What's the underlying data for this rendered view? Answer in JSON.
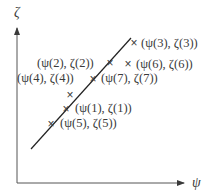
{
  "diagram": {
    "axes": {
      "y_label": "ζ",
      "x_label": "ψ"
    },
    "marker_glyph": "×",
    "fit_line": {
      "from": [
        31,
        149
      ],
      "to": [
        131,
        38
      ]
    },
    "points": [
      {
        "id": "p3",
        "label": "(ψ(3), ζ(3))",
        "mark": [
          134,
          44
        ],
        "label_pos": [
          141,
          47
        ]
      },
      {
        "id": "p2",
        "label": "(ψ(2), ζ(2))",
        "mark": [
          110,
          64
        ],
        "label_pos": [
          37,
          67
        ]
      },
      {
        "id": "p6",
        "label": "(ψ(6), ζ(6))",
        "mark": [
          128,
          65
        ],
        "label_pos": [
          136,
          68
        ]
      },
      {
        "id": "p4",
        "label": "(ψ(4), ζ(4))",
        "mark": null,
        "label_pos": [
          17,
          82
        ]
      },
      {
        "id": "p7",
        "label": "(ψ(7), ζ(7))",
        "mark": [
          93,
          80
        ],
        "label_pos": [
          101,
          82
        ]
      },
      {
        "id": "p8",
        "label": "",
        "mark": [
          70,
          96
        ],
        "label_pos": null
      },
      {
        "id": "p1",
        "label": "(ψ(1), ζ(1))",
        "mark": [
          66,
          110
        ],
        "label_pos": [
          75,
          112
        ]
      },
      {
        "id": "p5",
        "label": "(ψ(5), ζ(5))",
        "mark": [
          51,
          125
        ],
        "label_pos": [
          60,
          127
        ]
      }
    ]
  }
}
